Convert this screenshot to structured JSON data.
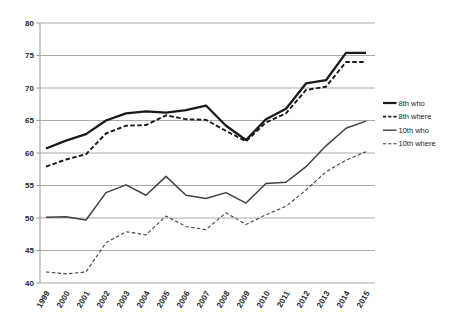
{
  "chart_data": {
    "type": "line",
    "title": "",
    "xlabel": "",
    "ylabel": "",
    "x": [
      "1999",
      "2000",
      "2001",
      "2002",
      "2003",
      "2004",
      "2005",
      "2006",
      "2007",
      "2008",
      "2009",
      "2010",
      "2011",
      "2012",
      "2013",
      "2014",
      "2015"
    ],
    "yticks": [
      40,
      45,
      50,
      55,
      60,
      65,
      70,
      75,
      80
    ],
    "ylim": [
      40,
      80
    ],
    "grid": true,
    "legend_position": "right",
    "colors": {
      "thick_line": "#1a1a1a",
      "thin_line": "#404040",
      "gridline": "#aaaaaa",
      "axis": "#999999",
      "tick_text": "#262626",
      "background": "#ffffff"
    },
    "series": [
      {
        "name": "8th who",
        "style": "solid",
        "weight": "thick",
        "values": [
          60.7,
          61.9,
          62.9,
          65.0,
          66.1,
          66.4,
          66.2,
          66.6,
          67.3,
          64.2,
          62.0,
          65.2,
          66.8,
          70.7,
          71.2,
          75.4,
          75.4
        ]
      },
      {
        "name": "8th where",
        "style": "dashed",
        "weight": "thick",
        "values": [
          57.9,
          59.0,
          59.8,
          63.0,
          64.2,
          64.3,
          65.8,
          65.2,
          65.1,
          63.4,
          61.8,
          64.7,
          66.1,
          69.7,
          70.2,
          74.0,
          74.0
        ]
      },
      {
        "name": "10th who",
        "style": "solid",
        "weight": "thin",
        "values": [
          50.1,
          50.2,
          49.7,
          53.9,
          55.1,
          53.5,
          56.4,
          53.5,
          53.0,
          53.9,
          52.3,
          55.3,
          55.5,
          57.9,
          61.1,
          63.8,
          64.9
        ]
      },
      {
        "name": "10th where",
        "style": "dashed",
        "weight": "thin",
        "values": [
          41.7,
          41.4,
          41.7,
          46.2,
          47.9,
          47.4,
          50.3,
          48.7,
          48.2,
          50.8,
          49.0,
          50.5,
          51.8,
          54.3,
          57.1,
          58.9,
          60.2
        ]
      }
    ]
  }
}
